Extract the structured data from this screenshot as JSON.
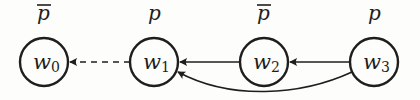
{
  "diagram": {
    "type": "kripke-model",
    "nodes": [
      {
        "id": "w0",
        "name": "w",
        "sub": "0",
        "prop": "p",
        "negated": true,
        "cx": 44
      },
      {
        "id": "w1",
        "name": "w",
        "sub": "1",
        "prop": "p",
        "negated": false,
        "cx": 154
      },
      {
        "id": "w2",
        "name": "w",
        "sub": "2",
        "prop": "p",
        "negated": true,
        "cx": 264
      },
      {
        "id": "w3",
        "name": "w",
        "sub": "3",
        "prop": "p",
        "negated": false,
        "cx": 374
      }
    ],
    "edges": [
      {
        "from": "w1",
        "to": "w0",
        "style": "dashed",
        "shape": "straight"
      },
      {
        "from": "w2",
        "to": "w1",
        "style": "solid",
        "shape": "straight"
      },
      {
        "from": "w3",
        "to": "w2",
        "style": "solid",
        "shape": "straight"
      },
      {
        "from": "w3",
        "to": "w1",
        "style": "solid",
        "shape": "curved-below"
      }
    ],
    "colors": {
      "stroke": "#1e1e1e",
      "background": "#fdfdfb"
    }
  }
}
